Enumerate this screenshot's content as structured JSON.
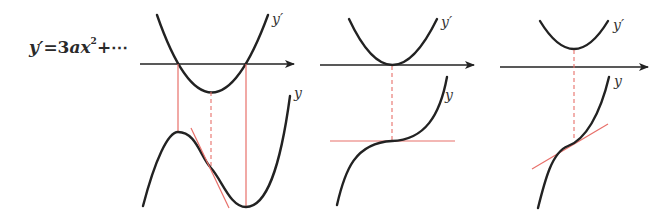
{
  "formula": {
    "lhs": "y′",
    "eq": "=3",
    "var": "ax",
    "exp": "2",
    "rest": "+⋯"
  },
  "panels": [
    {
      "id": "two-roots",
      "derivative_label": "y′",
      "function_label": "y",
      "description": "y′ has two roots: y has a local max and local min; tangent at inflection point"
    },
    {
      "id": "double-root",
      "derivative_label": "y′",
      "function_label": "y",
      "description": "y′ touches axis: y has horizontal tangent at inflection"
    },
    {
      "id": "no-roots",
      "derivative_label": "y′",
      "function_label": "y",
      "description": "y′ positive: y strictly increasing; tangent at inflection"
    }
  ],
  "colors": {
    "curve": "#222222",
    "guide": "#e8706a"
  }
}
